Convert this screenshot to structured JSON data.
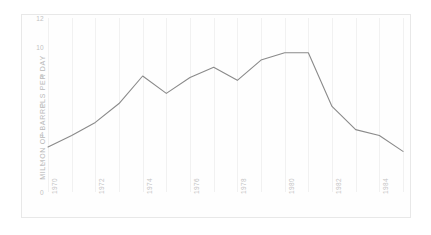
{
  "chart_data": {
    "type": "line",
    "title": "",
    "xlabel": "",
    "ylabel": "MILLION OF BARRELS PER DAY",
    "ylim": [
      0,
      12
    ],
    "xlim": [
      1970,
      1985
    ],
    "grid": "vertical",
    "legend": "none",
    "line_color": "#8a8a8a",
    "x": [
      1970,
      1971,
      1972,
      1973,
      1974,
      1975,
      1976,
      1977,
      1978,
      1979,
      1980,
      1981,
      1982,
      1983,
      1984,
      1985
    ],
    "values": [
      3.1,
      3.9,
      4.8,
      6.1,
      8.0,
      6.8,
      7.9,
      8.6,
      7.7,
      9.1,
      9.6,
      9.6,
      5.9,
      4.3,
      3.9,
      2.8
    ],
    "ytick_labels": [
      "12",
      "10",
      "8",
      "6",
      "4",
      "2",
      "0"
    ],
    "ytick_values": [
      12,
      10,
      8,
      6,
      4,
      2,
      0
    ],
    "xtick_labels": [
      "1970",
      "1972",
      "1974",
      "1976",
      "1978",
      "1980",
      "1982",
      "1984"
    ],
    "xtick_values": [
      1970,
      1972,
      1974,
      1976,
      1978,
      1980,
      1982,
      1984
    ],
    "gridline_years": [
      1970,
      1971,
      1972,
      1973,
      1974,
      1975,
      1976,
      1977,
      1978,
      1979,
      1980,
      1981,
      1982,
      1983,
      1984,
      1985
    ]
  }
}
